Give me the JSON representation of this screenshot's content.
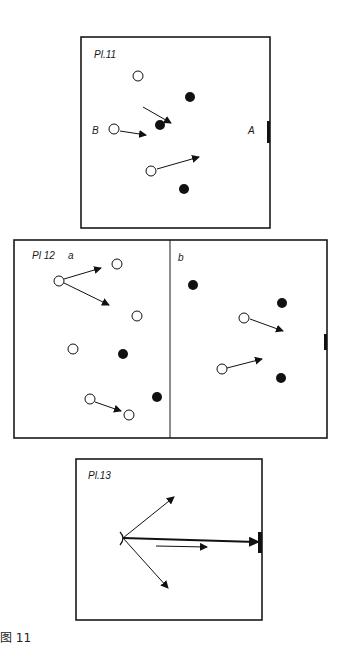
{
  "plates": [
    {
      "id": "pl11",
      "label": "Pl.11",
      "point_labels": {
        "B": "B",
        "A": "A"
      },
      "open_circles": [
        [
          115,
          130
        ],
        [
          138,
          103
        ],
        [
          152,
          172
        ]
      ],
      "filled_circles": [
        [
          190,
          97
        ],
        [
          160,
          125
        ],
        [
          184,
          189
        ]
      ],
      "arrows": [
        [
          143,
          107,
          170,
          123
        ],
        [
          120,
          131,
          146,
          135
        ],
        [
          157,
          169,
          198,
          157
        ]
      ]
    },
    {
      "id": "pl12",
      "label": "Pl 12",
      "panel_a_label": "a",
      "panel_b_label": "b",
      "open_circles": [
        [
          59,
          281
        ],
        [
          117,
          264
        ],
        [
          137,
          315
        ],
        [
          73,
          349
        ],
        [
          91,
          399
        ],
        [
          130,
          415
        ]
      ],
      "filled_circles": [
        [
          123,
          354
        ],
        [
          157,
          397
        ],
        [
          193,
          285
        ],
        [
          283,
          303
        ],
        [
          281,
          377
        ]
      ],
      "arrows": [
        [
          64,
          280,
          100,
          269
        ],
        [
          64,
          284,
          108,
          304
        ],
        [
          95,
          402,
          120,
          412
        ],
        [
          250,
          319,
          282,
          331
        ],
        [
          227,
          368,
          260,
          359
        ]
      ]
    },
    {
      "id": "pl13",
      "label": "Pl.13",
      "origin": [
        123,
        538
      ],
      "arrows": [
        [
          123,
          538,
          173,
          497
        ],
        [
          123,
          538,
          258,
          542
        ],
        [
          123,
          538,
          168,
          587
        ],
        [
          156,
          546,
          206,
          547
        ]
      ]
    }
  ],
  "caption": "图 11"
}
